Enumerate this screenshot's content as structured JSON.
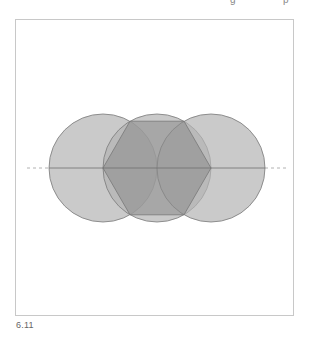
{
  "header": {
    "fragments": [
      "g",
      "p"
    ]
  },
  "figure": {
    "caption": "6.11",
    "colors": {
      "circle_fill": "#b4b4b4",
      "circle_stroke": "#7a7a7a",
      "hexagon_fill": "#8a8a8a",
      "axis_line": "#6e6e6e",
      "dashed_line": "#a0a0a0",
      "frame": "#c8c8c8"
    },
    "circles": [
      {
        "cx": 103,
        "cy": 168,
        "r": 54
      },
      {
        "cx": 157,
        "cy": 168,
        "r": 54
      },
      {
        "cx": 211,
        "cy": 168,
        "r": 54
      }
    ],
    "hexagon": {
      "cx": 157,
      "cy": 168,
      "r": 54
    }
  }
}
